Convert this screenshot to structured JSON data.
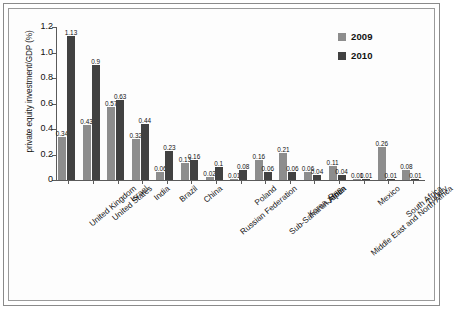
{
  "chart_data": {
    "type": "bar",
    "title": "",
    "xlabel": "",
    "ylabel": "private equity investment/GDP (%)",
    "ylim": [
      0,
      1.2
    ],
    "yticks": [
      "0",
      "0.2",
      "0.4",
      "0.6",
      "0.8",
      "1.0",
      "1.2"
    ],
    "ytick_values": [
      0,
      0.2,
      0.4,
      0.6,
      0.8,
      1.0,
      1.2
    ],
    "grid": false,
    "legend_position": "top-right",
    "categories": [
      "United Kingdom",
      "United States",
      "Israel",
      "India",
      "Brazil",
      "China",
      "Russian Federation",
      "Poland",
      "Sub-Saharan Africa",
      "Korea, Rep.",
      "Japan",
      "Middle East and North Africa",
      "Mexico",
      "South Africa",
      "Turkey"
    ],
    "series": [
      {
        "name": "2009",
        "color": "#8d8d8d",
        "values": [
          0.34,
          0.43,
          0.57,
          0.32,
          0.06,
          0.13,
          0.02,
          0.01,
          0.16,
          0.21,
          0.06,
          0.11,
          0.01,
          0.26,
          0.08
        ],
        "labels": [
          "0.34",
          "0.43",
          "0.57",
          "0.32",
          "0.06",
          "0.13",
          "0.02",
          "0.01",
          "0.16",
          "0.21",
          "0.06",
          "0.11",
          "0.01",
          "0.26",
          "0.08"
        ]
      },
      {
        "name": "2010",
        "color": "#414141",
        "values": [
          1.13,
          0.9,
          0.63,
          0.44,
          0.23,
          0.16,
          0.1,
          0.08,
          0.06,
          0.06,
          0.04,
          0.04,
          0.01,
          0.01,
          0.01
        ],
        "labels": [
          "1.13",
          "0.9",
          "0.63",
          "0.44",
          "0.23",
          "0.16",
          "0.1",
          "0.08",
          "0.06",
          "0.06",
          "0.04",
          "0.04",
          "0.01",
          "0.01",
          "0.01"
        ]
      }
    ]
  },
  "legend": {
    "items": [
      {
        "label": "2009",
        "color": "#8d8d8d"
      },
      {
        "label": "2010",
        "color": "#414141"
      }
    ]
  }
}
